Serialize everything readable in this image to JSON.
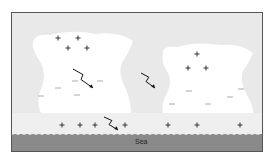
{
  "diagram": {
    "title": "",
    "colors": {
      "background": "#e9e9e9",
      "cloud": "#ffffff",
      "sea": "#8a8a8a",
      "frame_border": "#555555",
      "symbol": "#333333"
    },
    "sea_label": "Sea",
    "clouds": [
      {
        "name": "left-cloud",
        "positive_charges": [
          [
            57,
            37
          ],
          [
            77,
            37
          ],
          [
            67,
            47
          ],
          [
            86,
            47
          ]
        ],
        "negative_charges": [
          [
            57,
            87
          ],
          [
            74,
            80
          ],
          [
            99,
            80
          ],
          [
            40,
            95
          ],
          [
            76,
            94
          ]
        ],
        "lightning": {
          "from": [
            72,
            68
          ],
          "to": [
            92,
            87
          ]
        }
      },
      {
        "name": "right-cloud",
        "positive_charges": [
          [
            196,
            53
          ],
          [
            187,
            67
          ],
          [
            205,
            67
          ]
        ],
        "negative_charges": [
          [
            188,
            90
          ],
          [
            171,
            103
          ],
          [
            207,
            103
          ],
          [
            229,
            96
          ],
          [
            240,
            88
          ]
        ],
        "lightning": {
          "from": [
            140,
            72
          ],
          "to": [
            154,
            87
          ]
        }
      }
    ],
    "ground_positive_charges": [
      [
        61,
        124
      ],
      [
        79,
        124
      ],
      [
        94,
        124
      ],
      [
        124,
        124
      ],
      [
        167,
        124
      ],
      [
        196,
        124
      ],
      [
        239,
        124
      ]
    ],
    "ground_lightning": {
      "from": [
        103,
        116
      ],
      "to": [
        117,
        129
      ]
    },
    "symbols": {
      "positive": "+",
      "negative": "−"
    }
  }
}
